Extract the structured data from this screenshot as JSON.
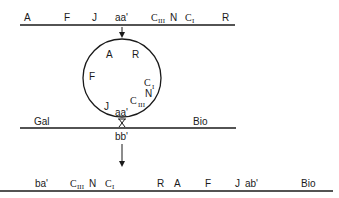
{
  "diagram": {
    "colors": {
      "line": "#1a1a1a",
      "background": "#ffffff"
    },
    "linear_phage": {
      "labels": [
        "A",
        "F",
        "J",
        "aa'",
        "C",
        "III",
        "N",
        "C",
        "I",
        "R"
      ]
    },
    "circular_phage": {
      "labels": [
        "A",
        "R",
        "F",
        "C",
        "I",
        "N",
        "C",
        "III",
        "J",
        "aa'"
      ]
    },
    "bacterial_chromosome": {
      "labels": [
        "Gal",
        "Bio"
      ],
      "site": "bb'"
    },
    "integrated_prophage": {
      "labels": [
        "ba'",
        "C",
        "III",
        "N",
        "C",
        "I",
        "R",
        "A",
        "F",
        "J",
        "ab'",
        "Bio"
      ]
    }
  }
}
